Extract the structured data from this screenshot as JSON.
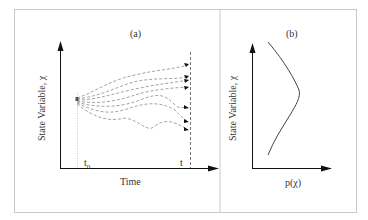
{
  "figure": {
    "panel_a": {
      "label": "(a)",
      "y_axis_label": "State Variable,  χ",
      "x_axis_label": "Time",
      "tick_start": "t",
      "tick_start_sub": "0",
      "tick_end": "t",
      "trajectory_count": 7
    },
    "panel_b": {
      "label": "(b)",
      "y_axis_label": "State Variable,  χ",
      "x_axis_label": "p(χ)"
    },
    "colors": {
      "frame": "#c8c8c8",
      "axis": "#111111",
      "trajectory": "#888888",
      "curve": "#444444"
    }
  }
}
